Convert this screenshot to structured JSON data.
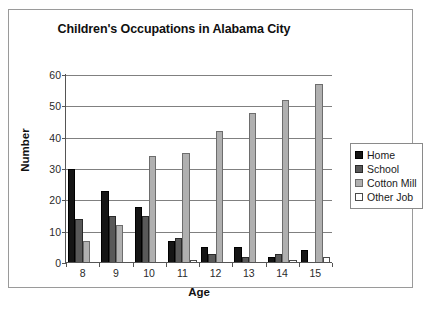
{
  "chart_data": {
    "type": "bar",
    "title": "Children's Occupations in Alabama City",
    "xlabel": "Age",
    "ylabel": "Number",
    "categories": [
      "8",
      "9",
      "10",
      "11",
      "12",
      "13",
      "14",
      "15"
    ],
    "ylim": [
      0,
      60
    ],
    "yticks": [
      0,
      10,
      20,
      30,
      40,
      50,
      60
    ],
    "grid": true,
    "legend_position": "right",
    "series": [
      {
        "name": "Home",
        "color": "#151515",
        "values": [
          30,
          23,
          18,
          7,
          5,
          5,
          2,
          4
        ]
      },
      {
        "name": "School",
        "color": "#595959",
        "values": [
          14,
          15,
          15,
          8,
          3,
          2,
          3,
          0
        ]
      },
      {
        "name": "Cotton Mill",
        "color": "#b0b0b0",
        "values": [
          7,
          12,
          34,
          35,
          42,
          48,
          52,
          57
        ]
      },
      {
        "name": "Other Job",
        "color": "#ffffff",
        "values": [
          0,
          0,
          0,
          1,
          0,
          0,
          1,
          2
        ]
      }
    ]
  }
}
